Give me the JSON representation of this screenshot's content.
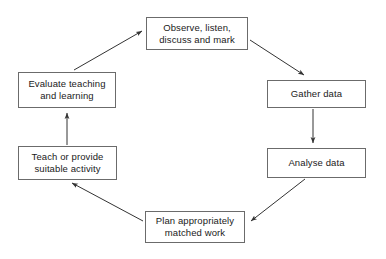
{
  "diagram": {
    "type": "cycle-flowchart",
    "background_color": "#ffffff",
    "box_border_color": "#6b6b6b",
    "arrow_color": "#333333",
    "text_color": "#1a1a1a",
    "nodes": [
      {
        "id": "observe",
        "label": "Observe, listen, discuss and mark",
        "line1": "Observe, listen,",
        "line2": "discuss and mark",
        "position": "top"
      },
      {
        "id": "gather",
        "label": "Gather data",
        "line1": "Gather data",
        "line2": "",
        "position": "right-upper"
      },
      {
        "id": "analyse",
        "label": "Analyse data",
        "line1": "Analyse data",
        "line2": "",
        "position": "right-lower"
      },
      {
        "id": "plan",
        "label": "Plan appropriately matched work",
        "line1": "Plan appropriately",
        "line2": "matched work",
        "position": "bottom"
      },
      {
        "id": "teach",
        "label": "Teach or provide suitable activity",
        "line1": "Teach or provide",
        "line2": "suitable activity",
        "position": "left-lower"
      },
      {
        "id": "evaluate",
        "label": "Evaluate teaching and learning",
        "line1": "Evaluate teaching",
        "line2": "and learning",
        "position": "left-upper"
      }
    ],
    "edges": [
      {
        "from": "observe",
        "to": "gather",
        "style": "diagonal",
        "arrowhead": "end"
      },
      {
        "from": "gather",
        "to": "analyse",
        "style": "vertical",
        "arrowhead": "end"
      },
      {
        "from": "analyse",
        "to": "plan",
        "style": "diagonal",
        "arrowhead": "end"
      },
      {
        "from": "plan",
        "to": "teach",
        "style": "diagonal",
        "arrowhead": "end"
      },
      {
        "from": "teach",
        "to": "evaluate",
        "style": "vertical",
        "arrowhead": "end"
      },
      {
        "from": "evaluate",
        "to": "observe",
        "style": "diagonal",
        "arrowhead": "end"
      }
    ]
  }
}
